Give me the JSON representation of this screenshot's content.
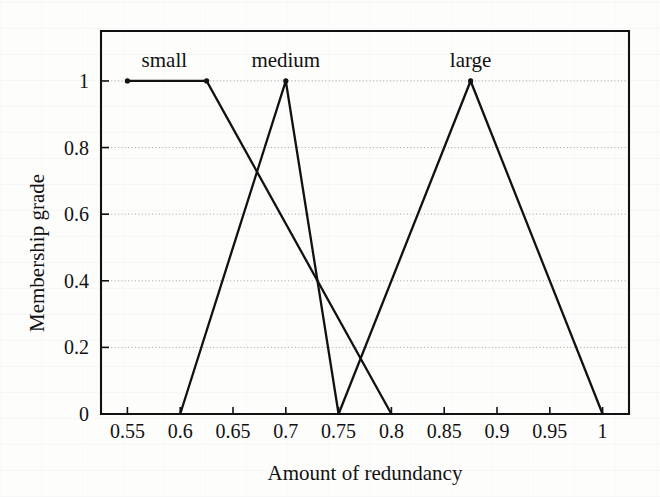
{
  "chart_data": {
    "type": "line",
    "title": "",
    "xlabel": "Amount of redundancy",
    "ylabel": "Membership grade",
    "xlim": [
      0.525,
      1.025
    ],
    "ylim": [
      0,
      1.15
    ],
    "grid": true,
    "legend_position": "inline-above-peaks",
    "xticks": [
      "0.55",
      "0.6",
      "0.65",
      "0.7",
      "0.75",
      "0.8",
      "0.85",
      "0.9",
      "0.95",
      "1"
    ],
    "xtick_values": [
      0.55,
      0.6,
      0.65,
      0.7,
      0.75,
      0.8,
      0.85,
      0.9,
      0.95,
      1
    ],
    "yticks": [
      "0",
      "0.2",
      "0.4",
      "0.6",
      "0.8",
      "1"
    ],
    "ytick_values": [
      0,
      0.2,
      0.4,
      0.6,
      0.8,
      1
    ],
    "series": [
      {
        "name": "small",
        "label_x": 0.585,
        "points": [
          {
            "x": 0.55,
            "y": 1
          },
          {
            "x": 0.625,
            "y": 1
          },
          {
            "x": 0.8,
            "y": 0
          }
        ]
      },
      {
        "name": "medium",
        "label_x": 0.7,
        "points": [
          {
            "x": 0.6,
            "y": 0
          },
          {
            "x": 0.7,
            "y": 1
          },
          {
            "x": 0.75,
            "y": 0
          }
        ]
      },
      {
        "name": "large",
        "label_x": 0.875,
        "points": [
          {
            "x": 0.75,
            "y": 0
          },
          {
            "x": 0.875,
            "y": 1
          },
          {
            "x": 1.0,
            "y": 0
          }
        ]
      }
    ],
    "colors": {
      "line": "#111111",
      "axis": "#111111",
      "grid": "#9a9a9a",
      "background": "#fdfdfc"
    }
  }
}
